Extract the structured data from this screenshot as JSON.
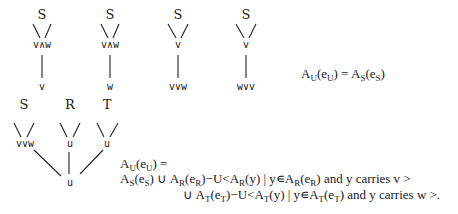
{
  "top_trees": [
    {
      "root": "S",
      "mid": "v∧w",
      "leaf": "v"
    },
    {
      "root": "S",
      "mid": "v∧w",
      "leaf": "w"
    },
    {
      "root": "S",
      "mid": "v",
      "leaf": "v∨w"
    },
    {
      "root": "S",
      "mid": "v",
      "leaf": "w∨v"
    }
  ],
  "top_equation": {
    "lhs": "A",
    "lhs_sub": "U",
    "lhs_arg": "e",
    "lhs_arg_sub": "U",
    "eq": "=",
    "rhs": "A",
    "rhs_sub": "S",
    "rhs_arg": "e",
    "rhs_arg_sub": "S"
  },
  "bottom_tree": {
    "subtrees": [
      {
        "root": "S",
        "mid": "v∨w"
      },
      {
        "root": "R",
        "mid": "u"
      },
      {
        "root": "T",
        "mid": "u"
      }
    ],
    "bottom": "u"
  },
  "bottom_equation": {
    "line1": {
      "A": "A",
      "sub": "U",
      "e": "e",
      "esub": "U",
      "tail": " ="
    },
    "line2": {
      "A": "A",
      "sub": "S",
      "e": "e",
      "esub": "S",
      "union": "∪",
      "A2": "A",
      "sub2": "R",
      "e2": "e",
      "esub2": "R",
      "minus": "−U<",
      "A3": "A",
      "sub3": "R",
      "y": "(y) | y∊",
      "A4": "A",
      "sub4": "R",
      "e4": "e",
      "esub4": "R",
      "tail": ") and y carries v >"
    },
    "line3": {
      "union": "∪",
      "A2": "A",
      "sub2": "T",
      "e2": "e",
      "esub2": "T",
      "minus": "−U<",
      "A3": "A",
      "sub3": "T",
      "y": "(y) | y∊",
      "A4": "A",
      "sub4": "T",
      "e4": "e",
      "esub4": "T",
      "tail": ") and y carries w >."
    }
  }
}
